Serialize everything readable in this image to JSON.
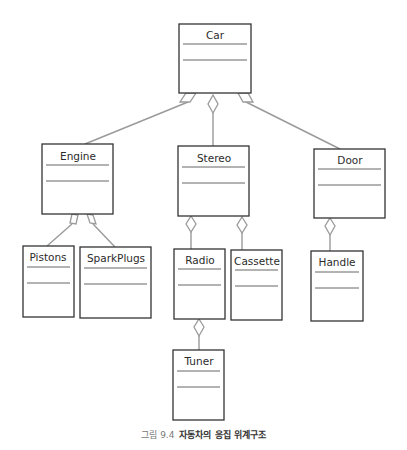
{
  "diagram": {
    "type": "UML aggregation hierarchy",
    "classes": [
      {
        "id": "car",
        "name": "Car",
        "x": 179,
        "y": 24,
        "w": 72,
        "h": 69
      },
      {
        "id": "engine",
        "name": "Engine",
        "x": 42,
        "y": 144,
        "w": 71,
        "h": 70
      },
      {
        "id": "stereo",
        "name": "Stereo",
        "x": 178,
        "y": 146,
        "w": 71,
        "h": 70
      },
      {
        "id": "door",
        "name": "Door",
        "x": 314,
        "y": 149,
        "w": 71,
        "h": 69
      },
      {
        "id": "pistons",
        "name": "Pistons",
        "x": 23,
        "y": 246,
        "w": 51,
        "h": 71
      },
      {
        "id": "sparkplugs",
        "name": "SparkPlugs",
        "x": 80,
        "y": 247,
        "w": 71,
        "h": 71
      },
      {
        "id": "radio",
        "name": "Radio",
        "x": 174,
        "y": 249,
        "w": 51,
        "h": 70
      },
      {
        "id": "cassette",
        "name": "Cassette",
        "x": 231,
        "y": 250,
        "w": 51,
        "h": 70
      },
      {
        "id": "handle",
        "name": "Handle",
        "x": 311,
        "y": 251,
        "w": 52,
        "h": 70
      },
      {
        "id": "tuner",
        "name": "Tuner",
        "x": 173,
        "y": 350,
        "w": 51,
        "h": 70
      }
    ],
    "relations": [
      {
        "whole": "Car",
        "part": "Engine",
        "kind": "aggregation"
      },
      {
        "whole": "Car",
        "part": "Stereo",
        "kind": "aggregation"
      },
      {
        "whole": "Car",
        "part": "Door",
        "kind": "aggregation"
      },
      {
        "whole": "Engine",
        "part": "Pistons",
        "kind": "aggregation"
      },
      {
        "whole": "Engine",
        "part": "SparkPlugs",
        "kind": "aggregation"
      },
      {
        "whole": "Stereo",
        "part": "Radio",
        "kind": "aggregation"
      },
      {
        "whole": "Stereo",
        "part": "Cassette",
        "kind": "aggregation"
      },
      {
        "whole": "Door",
        "part": "Handle",
        "kind": "aggregation"
      },
      {
        "whole": "Radio",
        "part": "Tuner",
        "kind": "aggregation"
      }
    ],
    "colors": {
      "box_stroke": "#333333",
      "line": "#999999",
      "divider": "#555555"
    }
  },
  "caption": {
    "figure_label": "그림 9.4",
    "title": "자동차의 응집 위계구조"
  }
}
